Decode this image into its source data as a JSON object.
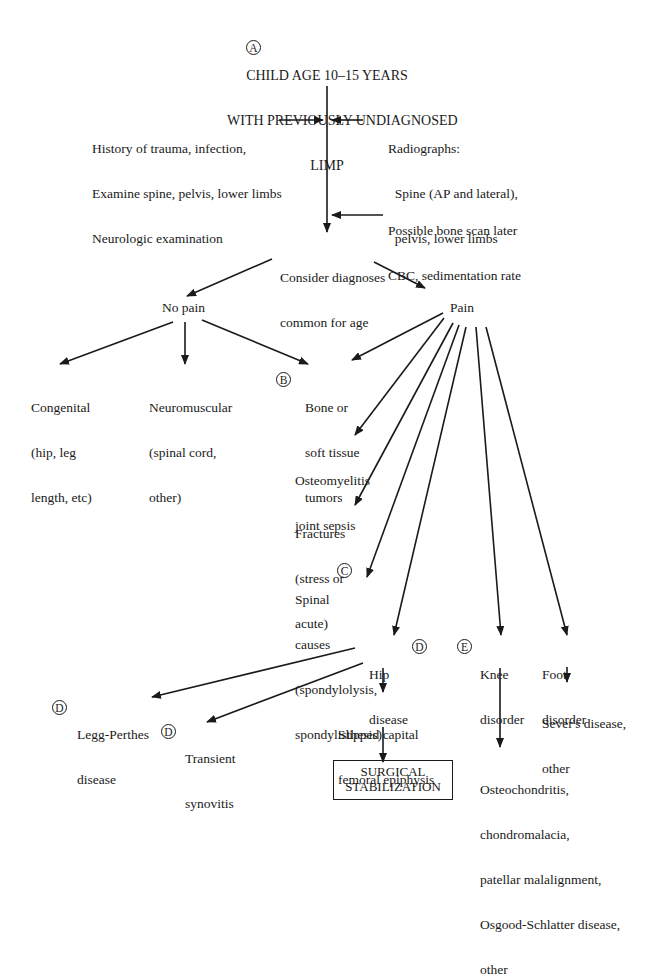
{
  "title": {
    "badge": "A",
    "lines": [
      "CHILD AGE 10–15 YEARS",
      "WITH PREVIOUSLY UNDIAGNOSED",
      "LIMP"
    ]
  },
  "inputs_left": [
    "History of trauma, infection,",
    "Examine spine, pelvis, lower limbs",
    "Neurologic examination"
  ],
  "inputs_right_radiographs": [
    "Radiographs:",
    "  Spine (AP and lateral),",
    "  pelvis, lower limbs"
  ],
  "inputs_right_labs": [
    "Possible bone scan later",
    "CBC, sedimentation rate"
  ],
  "consider": [
    "Consider diagnoses",
    "common for age"
  ],
  "no_pain": {
    "label": "No pain",
    "children": [
      {
        "lines": [
          "Congenital",
          "(hip, leg",
          "length, etc)"
        ]
      },
      {
        "lines": [
          "Neuromuscular",
          "(spinal cord,",
          "other)"
        ]
      },
      {
        "badge": "B",
        "lines": [
          "Bone or",
          "soft tissue",
          "tumors"
        ]
      }
    ]
  },
  "pain": {
    "label": "Pain",
    "children": {
      "osteomyelitis": [
        "Osteomyelitis",
        "joint sepsis"
      ],
      "fractures": [
        "Fractures",
        "(stress or",
        "acute)"
      ],
      "spinal": {
        "badge": "C",
        "lines": [
          "Spinal",
          "causes",
          "(spondylolysis,",
          "spondylisthesis)"
        ]
      },
      "hip": {
        "badge": "D",
        "lines": [
          "Hip",
          "disease"
        ]
      },
      "knee": {
        "badge": "E",
        "lines": [
          "Knee",
          "disorder"
        ]
      },
      "foot": {
        "lines": [
          "Foot",
          "disorder"
        ]
      }
    }
  },
  "hip_children": {
    "legg": {
      "badge": "D",
      "lines": [
        "Legg-Perthes",
        "disease"
      ]
    },
    "transient": {
      "badge": "D",
      "lines": [
        "Transient",
        "synovitis"
      ]
    },
    "scfe": [
      "Slipped capital",
      "femoral epiphysis"
    ]
  },
  "surgical": [
    "SURGICAL",
    "STABILIZATION"
  ],
  "knee_outcome": [
    "Osteochondritis,",
    "chondromalacia,",
    "patellar malalignment,",
    "Osgood-Schlatter disease,",
    "other"
  ],
  "foot_outcome": [
    "Sever's disease,",
    "other"
  ]
}
